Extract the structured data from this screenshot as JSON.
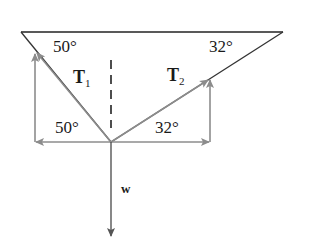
{
  "diagram": {
    "title": "",
    "labels": {
      "angle_top_left": "50°",
      "angle_top_right": "32°",
      "angle_bottom_left": "50°",
      "angle_bottom_right": "32°",
      "tension1": "T",
      "tension1_sub": "1",
      "tension2": "T",
      "tension2_sub": "2",
      "weight": "w"
    },
    "colors": {
      "rope": "#333333",
      "component": "#8c8c8c",
      "weight": "#555555",
      "ceiling": "#222222"
    }
  }
}
